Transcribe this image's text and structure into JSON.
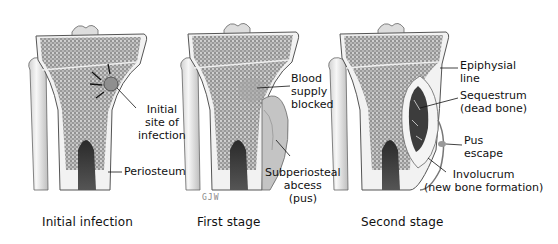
{
  "figure": {
    "panels": [
      {
        "id": "initial",
        "caption": "Initial infection",
        "labels": [
          {
            "id": "site",
            "lines": [
              "Initial",
              "site of",
              "infection"
            ]
          },
          {
            "id": "periosteum",
            "lines": [
              "Periosteum"
            ]
          }
        ]
      },
      {
        "id": "first",
        "caption": "First stage",
        "labels": [
          {
            "id": "blood",
            "lines": [
              "Blood",
              "supply",
              "blocked"
            ]
          },
          {
            "id": "abscess",
            "lines": [
              "Subperiosteal",
              "abcess",
              "(pus)"
            ]
          }
        ],
        "signature": "GJW"
      },
      {
        "id": "second",
        "caption": "Second stage",
        "labels": [
          {
            "id": "epiphysial",
            "lines": [
              "Epiphysial",
              "line"
            ]
          },
          {
            "id": "sequestrum",
            "lines": [
              "Sequestrum",
              "(dead bone)"
            ]
          },
          {
            "id": "pus",
            "lines": [
              "Pus",
              "escape"
            ]
          },
          {
            "id": "involucrum",
            "lines": [
              "Involucrum",
              "(new bone formation)"
            ]
          }
        ]
      }
    ],
    "colors": {
      "bone_outline": "#555555",
      "cortex": "#efefef",
      "spongy": "#8a8a8a",
      "marrow": "#3a3a3a",
      "pus": "#b8b8b8"
    }
  }
}
